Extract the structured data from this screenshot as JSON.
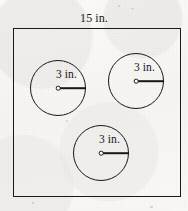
{
  "figure": {
    "type": "geometry-diagram",
    "square": {
      "label": "15 in.",
      "side_value": 15,
      "unit": "in.",
      "label_position": "top-center"
    },
    "circles": [
      {
        "id": "circle-left",
        "label": "3 in.",
        "radius_value": 3,
        "unit": "in.",
        "center": {
          "x": 58,
          "y": 88
        },
        "radius_px": 28,
        "label_position": "above-radius"
      },
      {
        "id": "circle-top-right",
        "label": "3 in.",
        "radius_value": 3,
        "unit": "in.",
        "center": {
          "x": 136,
          "y": 81
        },
        "radius_px": 28,
        "label_position": "above-radius"
      },
      {
        "id": "circle-bottom",
        "label": "3 in.",
        "radius_value": 3,
        "unit": "in.",
        "center": {
          "x": 101,
          "y": 153
        },
        "radius_px": 28,
        "label_position": "above-radius"
      }
    ],
    "colors": {
      "ink": "#17171b",
      "paper": "#f7f6f4"
    }
  }
}
